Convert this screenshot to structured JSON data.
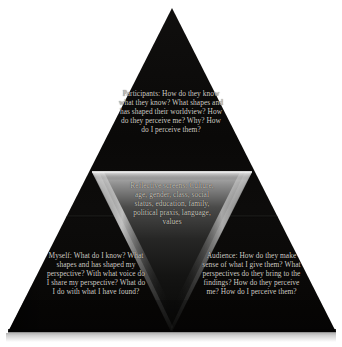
{
  "diagram": {
    "shape": "triangle-with-inverted-inner-triangle",
    "background_color": "#ffffff",
    "pyramid_color": "#0a0908",
    "highlight_color": "#d8d8d8",
    "text_color": "#cfcbc4",
    "base_shadow_color": "#d9d9d9"
  },
  "nodes": {
    "participants": {
      "name": "participants-block",
      "text": "Participants: How do they know what they know? What shapes and has shaped their worldview? How do they perceive me? Why? How do I perceive them?"
    },
    "reflective_screens": {
      "name": "reflective-screens-block",
      "text": "Reflective screens: Culture, age, gender, class, social status, education, family, political praxis, language, values"
    },
    "myself": {
      "name": "myself-block",
      "text": "Myself: What do I know? What shapes and has shaped my perspective? With what voice do I share my perspective? What do I do with what I have found?"
    },
    "audience": {
      "name": "audience-block",
      "text": "Audience: How do they make sense of what I give them? What perspectives do they bring to the findings? How do they perceive me? How do I perceive them?"
    }
  }
}
